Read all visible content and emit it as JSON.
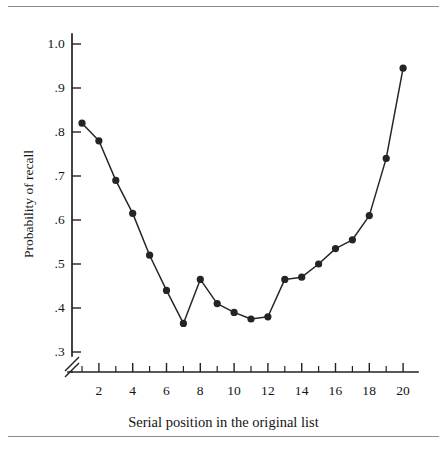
{
  "figure": {
    "frame_name": "serial-position-curve-figure",
    "background_color": "#ffffff",
    "rule_color": "#8d8d8d",
    "ink_color": "#242424"
  },
  "chart_data": {
    "type": "line",
    "title": "",
    "subtitle": "",
    "xlabel": "Serial position in the original list",
    "ylabel": "Probability of recall",
    "x": [
      1,
      2,
      3,
      4,
      5,
      6,
      7,
      8,
      9,
      10,
      11,
      12,
      13,
      14,
      15,
      16,
      17,
      18,
      19,
      20
    ],
    "values": [
      0.82,
      0.78,
      0.69,
      0.615,
      0.52,
      0.44,
      0.365,
      0.465,
      0.41,
      0.39,
      0.375,
      0.38,
      0.465,
      0.47,
      0.5,
      0.535,
      0.555,
      0.61,
      0.74,
      0.945
    ],
    "series": [
      {
        "name": "Probability of recall",
        "values": [
          0.82,
          0.78,
          0.69,
          0.615,
          0.52,
          0.44,
          0.365,
          0.465,
          0.41,
          0.39,
          0.375,
          0.38,
          0.465,
          0.47,
          0.5,
          0.535,
          0.555,
          0.61,
          0.74,
          0.945
        ],
        "marker": "filled-circle",
        "color": "#242424"
      }
    ],
    "xlim": [
      0.3,
      20.7
    ],
    "ylim": [
      0.3,
      1.0
    ],
    "y_ticks": [
      0.3,
      0.4,
      0.5,
      0.6,
      0.7,
      0.8,
      0.9,
      1.0
    ],
    "y_tick_labels": [
      ".3",
      ".4",
      ".5",
      ".6",
      ".7",
      ".8",
      ".9",
      "1.0"
    ],
    "x_ticks": [
      1,
      2,
      3,
      4,
      5,
      6,
      7,
      8,
      9,
      10,
      11,
      12,
      13,
      14,
      15,
      16,
      17,
      18,
      19,
      20
    ],
    "x_tick_labels_shown": [
      "2",
      "4",
      "6",
      "8",
      "10",
      "12",
      "14",
      "16",
      "18",
      "20"
    ],
    "x_tick_label_positions": [
      2,
      4,
      6,
      8,
      10,
      12,
      14,
      16,
      18,
      20
    ],
    "grid": false,
    "legend": false,
    "legend_position": "none",
    "y_axis_break": true,
    "annotations": []
  }
}
